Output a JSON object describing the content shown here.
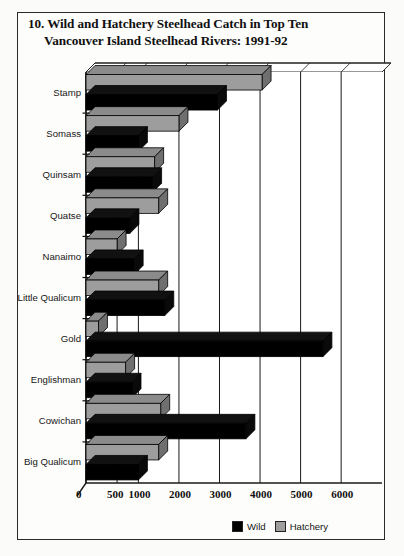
{
  "figure": {
    "number": "10.",
    "title_line1": "10.  Wild and Hatchery Steelhead Catch in Top Ten",
    "title_line2": "Vancouver Island Steelhead Rivers: 1991-92"
  },
  "legend": {
    "position": "bottom-right",
    "entries": [
      {
        "label": "Wild",
        "color": "#000000"
      },
      {
        "label": "Hatchery",
        "color": "#9d9d9d"
      }
    ]
  },
  "chart_data": {
    "type": "bar",
    "orientation": "horizontal",
    "title": "Wild and Hatchery Steelhead Catch in Top Ten Vancouver Island Steelhead Rivers: 1991-92",
    "xlabel": "",
    "ylabel": "",
    "grid": true,
    "xlim": [
      0,
      6000
    ],
    "xticks": [
      0,
      500,
      1000,
      2000,
      3000,
      4000,
      5000,
      6000
    ],
    "xticklabels": [
      "0",
      "500",
      "1000",
      "2000",
      "3000",
      "4000",
      "5000",
      "6000"
    ],
    "categories": [
      "Stamp",
      "Somass",
      "Quinsam",
      "Quatse",
      "Nanaimo",
      "Little Qualicum",
      "Gold",
      "Englishman",
      "Cowichan",
      "Big Qualicum"
    ],
    "series": [
      {
        "name": "Hatchery",
        "color": "#9d9d9d",
        "values": [
          4050,
          2000,
          1400,
          1500,
          500,
          1500,
          200,
          700,
          1550,
          1500
        ]
      },
      {
        "name": "Wild",
        "color": "#000000",
        "values": [
          2950,
          1000,
          1350,
          800,
          900,
          1650,
          5550,
          850,
          3650,
          1000
        ]
      }
    ]
  }
}
